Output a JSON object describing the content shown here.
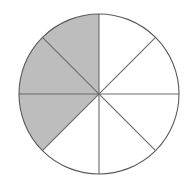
{
  "figure": {
    "name": "fraction-circle-diagram",
    "total_sectors": 8,
    "shaded_sectors": 3,
    "unshaded_sectors": 5,
    "fraction_shaded": "3/8",
    "fraction_unshaded": "5/8",
    "sector_angle_degrees": 45,
    "background_color": "#ffffff"
  },
  "geometry": {
    "center_x": 99,
    "center_y": 94,
    "radius": 80,
    "outline_color": "#5a5a5a",
    "outline_width": 1.1,
    "divider_color": "#6a6a6a",
    "divider_width": 1.1,
    "shaded_fill": "#bdbdbd",
    "unshaded_fill": "#ffffff"
  },
  "dividers": [
    {
      "name": "vertical-diameter",
      "angle_degrees": 90,
      "label": "vertical"
    },
    {
      "name": "horizontal-diameter",
      "angle_degrees": 0,
      "label": "horizontal"
    },
    {
      "name": "diagonal-diameter-45",
      "angle_degrees": 45,
      "label": "diagonal-up-right"
    },
    {
      "name": "diagonal-diameter-135",
      "angle_degrees": 135,
      "label": "diagonal-up-left"
    }
  ],
  "sectors": [
    {
      "index": 0,
      "start_degrees": 0,
      "end_degrees": 45,
      "shaded": false,
      "position": "upper-right-outer"
    },
    {
      "index": 1,
      "start_degrees": 45,
      "end_degrees": 90,
      "shaded": false,
      "position": "upper-right-inner"
    },
    {
      "index": 2,
      "start_degrees": 90,
      "end_degrees": 135,
      "shaded": true,
      "position": "upper-left-inner"
    },
    {
      "index": 3,
      "start_degrees": 135,
      "end_degrees": 180,
      "shaded": true,
      "position": "upper-left-outer"
    },
    {
      "index": 4,
      "start_degrees": 180,
      "end_degrees": 225,
      "shaded": true,
      "position": "lower-left-outer"
    },
    {
      "index": 5,
      "start_degrees": 225,
      "end_degrees": 270,
      "shaded": false,
      "position": "lower-left-inner"
    },
    {
      "index": 6,
      "start_degrees": 270,
      "end_degrees": 315,
      "shaded": false,
      "position": "lower-right-inner"
    },
    {
      "index": 7,
      "start_degrees": 315,
      "end_degrees": 360,
      "shaded": false,
      "position": "lower-right-outer"
    }
  ]
}
